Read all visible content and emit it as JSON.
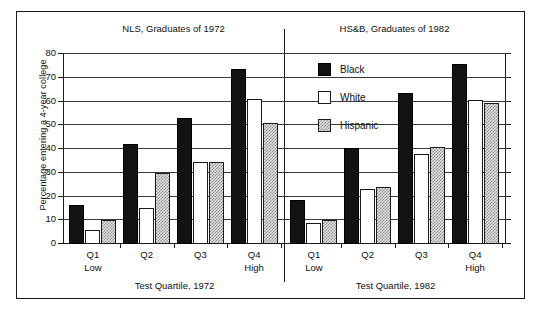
{
  "chart_data": {
    "type": "bar",
    "title": "",
    "ylabel": "Percentage entering a 4-year college",
    "ylim": [
      0,
      80
    ],
    "yticks": [
      0,
      10,
      20,
      30,
      40,
      50,
      60,
      70,
      80
    ],
    "grid": true,
    "legend_position": "top-center-right",
    "legend": [
      "Black",
      "White",
      "Hispanic"
    ],
    "panels": [
      {
        "title": "NLS, Graduates of 1972",
        "xlabel": "Test Quartile, 1972",
        "categories": [
          "Q1",
          "Q2",
          "Q3",
          "Q4"
        ],
        "category_sublabels": [
          "Low",
          "",
          "",
          "High"
        ],
        "series": [
          {
            "name": "Black",
            "values": [
              16.5,
              42,
              53,
              73.5
            ]
          },
          {
            "name": "White",
            "values": [
              6,
              15,
              34.5,
              61
            ]
          },
          {
            "name": "Hispanic",
            "values": [
              10,
              30,
              34.5,
              51
            ]
          }
        ]
      },
      {
        "title": "HS&B, Graduates of 1982",
        "xlabel": "Test Quartile, 1982",
        "categories": [
          "Q1",
          "Q2",
          "Q3",
          "Q4"
        ],
        "category_sublabels": [
          "Low",
          "",
          "",
          "High"
        ],
        "series": [
          {
            "name": "Black",
            "values": [
              18.5,
              40.5,
              63.5,
              76
            ]
          },
          {
            "name": "White",
            "values": [
              9,
              23,
              38,
              60.5
            ]
          },
          {
            "name": "Hispanic",
            "values": [
              10,
              24,
              41,
              59.5
            ]
          }
        ]
      }
    ],
    "colors": {
      "black_series": "#121212",
      "white_series": "#ffffff",
      "hispanic_series": "#e2e2e2",
      "axis": "#1b1b1b"
    }
  }
}
